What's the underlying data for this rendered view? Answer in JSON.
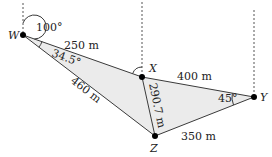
{
  "diagram": {
    "type": "triangle-bearing-diagram",
    "points": [
      {
        "id": "W",
        "label": "W"
      },
      {
        "id": "X",
        "label": "X"
      },
      {
        "id": "Y",
        "label": "Y"
      },
      {
        "id": "Z",
        "label": "Z"
      }
    ],
    "edges": [
      {
        "from": "W",
        "to": "X",
        "label": "250 m"
      },
      {
        "from": "X",
        "to": "Y",
        "label": "400 m"
      },
      {
        "from": "W",
        "to": "Z",
        "label": "460 m"
      },
      {
        "from": "X",
        "to": "Z",
        "label": "290.7 m"
      },
      {
        "from": "Z",
        "to": "Y",
        "label": "350 m"
      }
    ],
    "angles": [
      {
        "at": "W",
        "label": "100°",
        "kind": "bearing"
      },
      {
        "at": "W",
        "label": "34.5°",
        "kind": "interior"
      },
      {
        "at": "Y",
        "label": "45°",
        "kind": "interior"
      },
      {
        "at": "X",
        "label": "",
        "kind": "bearing-arc"
      }
    ],
    "colors": {
      "fill": "#ebebeb",
      "line": "#3a3a3a",
      "dash": "#555555",
      "dot": "#000000"
    }
  }
}
